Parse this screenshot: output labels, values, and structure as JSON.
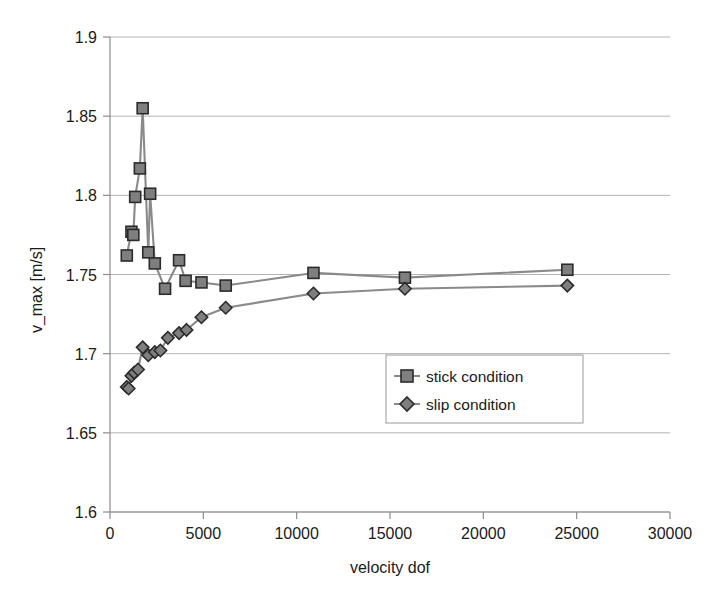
{
  "chart_data": {
    "type": "line",
    "title": "",
    "subtitle": "",
    "xlabel": "velocity dof",
    "ylabel": "v_max [m/s]",
    "xlim": [
      0,
      30000
    ],
    "ylim": [
      1.6,
      1.9
    ],
    "xticks": [
      0,
      5000,
      10000,
      15000,
      20000,
      25000,
      30000
    ],
    "xtick_labels": [
      "0",
      "5000",
      "10000",
      "15000",
      "20000",
      "25000",
      "30000"
    ],
    "yticks": [
      1.6,
      1.65,
      1.7,
      1.75,
      1.8,
      1.85,
      1.9
    ],
    "ytick_labels": [
      "1.6",
      "1.65",
      "1.7",
      "1.75",
      "1.8",
      "1.85",
      "1.9"
    ],
    "grid": "horizontal",
    "legend_position": "center-right",
    "series": [
      {
        "name": "stick condition",
        "marker": "square",
        "color": "#7f7f7f",
        "line_color": "#8a8a8a",
        "x": [
          900,
          1150,
          1250,
          1350,
          1600,
          1750,
          2050,
          2150,
          2400,
          2950,
          3700,
          4050,
          4900,
          6200,
          10900,
          15800,
          24500
        ],
        "y": [
          1.762,
          1.777,
          1.775,
          1.799,
          1.817,
          1.855,
          1.764,
          1.801,
          1.757,
          1.741,
          1.759,
          1.746,
          1.745,
          1.743,
          1.751,
          1.748,
          1.753
        ]
      },
      {
        "name": "slip condition",
        "marker": "diamond",
        "color": "#7f7f7f",
        "line_color": "#8a8a8a",
        "x": [
          900,
          1000,
          1150,
          1300,
          1500,
          1750,
          2050,
          2400,
          2700,
          3100,
          3700,
          4100,
          4900,
          6200,
          10900,
          15800,
          24500
        ],
        "y": [
          1.679,
          1.678,
          1.686,
          1.688,
          1.69,
          1.704,
          1.699,
          1.701,
          1.702,
          1.71,
          1.713,
          1.715,
          1.723,
          1.729,
          1.738,
          1.741,
          1.743
        ]
      }
    ]
  },
  "legend": {
    "entries": [
      {
        "label": "stick condition",
        "marker": "square"
      },
      {
        "label": "slip condition",
        "marker": "diamond"
      }
    ]
  },
  "axes": {
    "x_title": "velocity dof",
    "y_title": "v_max [m/s]"
  }
}
